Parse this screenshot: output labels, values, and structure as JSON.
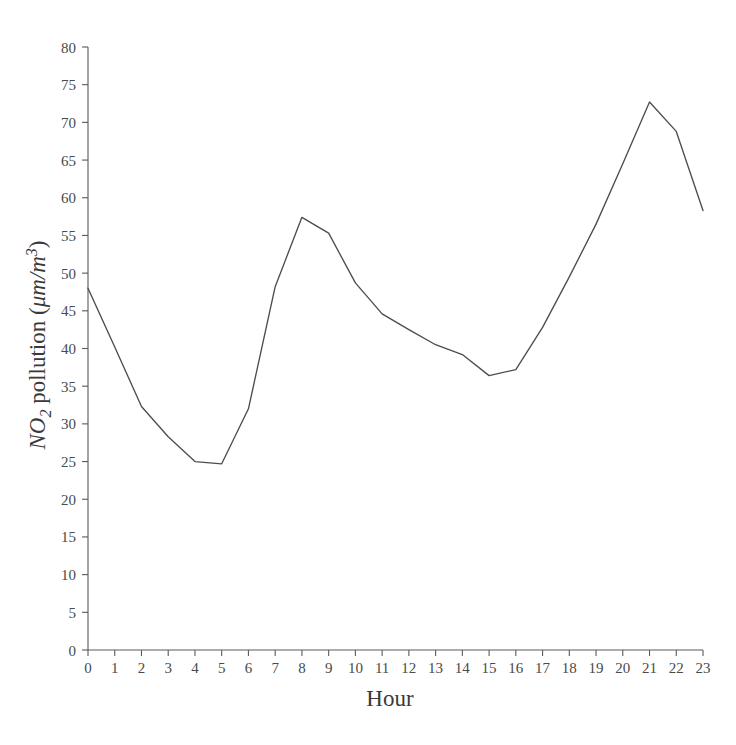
{
  "figure": {
    "background_color": "#ffffff",
    "line_color": "#4d4d4d",
    "axis_color": "#5a5a5a"
  },
  "chart_data": {
    "type": "line",
    "title": "",
    "subtitle": "",
    "xlabel": "Hour",
    "ylabel": "NO2 pollution (μm/m³)",
    "ylabel_parts": {
      "species": "NO",
      "subscript": "2",
      "rest": " pollution (",
      "units_mu": "μm/m",
      "units_exponent": "3",
      "close": ")"
    },
    "x": [
      0,
      1,
      2,
      3,
      4,
      5,
      6,
      7,
      8,
      9,
      10,
      11,
      12,
      13,
      14,
      15,
      16,
      17,
      18,
      19,
      20,
      21,
      22,
      23
    ],
    "values": [
      48.0,
      40.2,
      32.3,
      28.3,
      25.0,
      24.7,
      32.0,
      48.2,
      57.4,
      55.3,
      48.7,
      44.6,
      42.5,
      40.5,
      39.2,
      36.4,
      37.2,
      42.8,
      49.5,
      56.5,
      64.5,
      72.7,
      68.8,
      58.3
    ],
    "xlim": [
      0,
      23
    ],
    "ylim": [
      0,
      80
    ],
    "xticks": [
      0,
      1,
      2,
      3,
      4,
      5,
      6,
      7,
      8,
      9,
      10,
      11,
      12,
      13,
      14,
      15,
      16,
      17,
      18,
      19,
      20,
      21,
      22,
      23
    ],
    "xtick_labels": [
      "0",
      "1",
      "2",
      "3",
      "4",
      "5",
      "6",
      "7",
      "8",
      "9",
      "10",
      "11",
      "12",
      "13",
      "14",
      "15",
      "16",
      "17",
      "18",
      "19",
      "20",
      "21",
      "22",
      "23"
    ],
    "yticks": [
      0,
      5,
      10,
      15,
      20,
      25,
      30,
      35,
      40,
      45,
      50,
      55,
      60,
      65,
      70,
      75,
      80
    ],
    "ytick_labels": [
      "0",
      "5",
      "10",
      "15",
      "20",
      "25",
      "30",
      "35",
      "40",
      "45",
      "50",
      "55",
      "60",
      "65",
      "70",
      "75",
      "80"
    ],
    "grid": false,
    "legend": false,
    "legend_position": "none",
    "series": [
      {
        "name": "NO2 pollution",
        "values": [
          48.0,
          40.2,
          32.3,
          28.3,
          25.0,
          24.7,
          32.0,
          48.2,
          57.4,
          55.3,
          48.7,
          44.6,
          42.5,
          40.5,
          39.2,
          36.4,
          37.2,
          42.8,
          49.5,
          56.5,
          64.5,
          72.7,
          68.8,
          58.3
        ]
      }
    ],
    "annotations": []
  }
}
